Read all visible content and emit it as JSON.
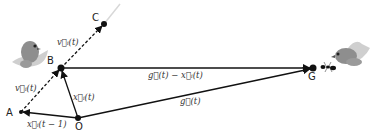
{
  "diagram": {
    "type": "vector-diagram",
    "points": [
      {
        "id": "A",
        "label": "A",
        "x": 21,
        "y": 112
      },
      {
        "id": "B",
        "label": "B",
        "x": 61,
        "y": 68
      },
      {
        "id": "C",
        "label": "C",
        "x": 104,
        "y": 24
      },
      {
        "id": "O",
        "label": "O",
        "x": 78,
        "y": 118
      },
      {
        "id": "G",
        "label": "G",
        "x": 313,
        "y": 68
      }
    ],
    "vectors": [
      {
        "id": "x_prev",
        "from": "O",
        "to": "A",
        "style": "solid",
        "label": "x⃗ᵢ(t − 1)"
      },
      {
        "id": "x_now",
        "from": "O",
        "to": "B",
        "style": "solid",
        "label": "x⃗ᵢ(t)"
      },
      {
        "id": "v_ab",
        "from": "A",
        "to": "B",
        "style": "dashed",
        "label": "v⃗ᵢ(t)"
      },
      {
        "id": "v_bc",
        "from": "B",
        "to": "C",
        "style": "dashed",
        "label": "v⃗ᵢ(t)"
      },
      {
        "id": "g_minus_x",
        "from": "B",
        "to": "G",
        "style": "solid",
        "label": "g⃗(t) − x⃗ᵢ(t)"
      },
      {
        "id": "g",
        "from": "O",
        "to": "G",
        "style": "solid",
        "label": "g⃗(t)"
      }
    ],
    "icons": [
      {
        "name": "bird-icon",
        "position": "near B, upper left"
      },
      {
        "name": "bird-icon",
        "position": "near G, upper right"
      },
      {
        "name": "ant-icon",
        "position": "right of G"
      }
    ]
  },
  "labels": {
    "A": "A",
    "B": "B",
    "C": "C",
    "O": "O",
    "G": "G",
    "x_prev": "x⃗ᵢ(t − 1)",
    "x_now": "x⃗ᵢ(t)",
    "v_lower": "v⃗ᵢ(t)",
    "v_upper": "v⃗ᵢ(t)",
    "g_minus_x": "g⃗(t) − x⃗ᵢ(t)",
    "g": "g⃗(t)"
  },
  "colors": {
    "line": "#111111",
    "bird_body": "#8a8a8a",
    "bird_wing": "#c8c8c8",
    "fade_line": "#d8d8d8"
  }
}
